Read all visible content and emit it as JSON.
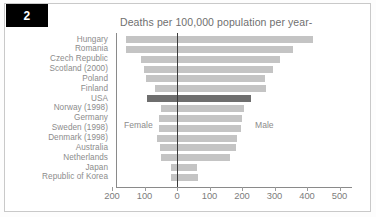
{
  "figure": {
    "number_tab": "2",
    "title": "Deaths per 100,000 population per year-",
    "accent_dark": "#6e6e6e",
    "accent_light": "#c4c4c4",
    "zero_line_color": "#3a3a3a",
    "text_color": "#8c8c8c"
  },
  "labels": {
    "female": "Female",
    "male": "Male"
  },
  "chart_data": {
    "type": "bar",
    "orientation": "horizontal-diverging",
    "title": "Deaths per 100,000 population per year-",
    "xlabel": "",
    "ylabel": "",
    "xlim": [
      -230,
      540
    ],
    "grid": false,
    "legend_position": "inside-plot",
    "annotations": [
      "Female",
      "Male"
    ],
    "tick_values": [
      -200,
      -100,
      0,
      100,
      200,
      300,
      400,
      500
    ],
    "tick_labels": [
      "200",
      "100",
      "0",
      "100",
      "200",
      "300",
      "400",
      "500"
    ],
    "categories": [
      "Hungary",
      "Romania",
      "Czech Republic",
      "Scotland (2000)",
      "Poland",
      "Finland",
      "USA",
      "Norway (1998)",
      "Germany",
      "Sweden (1998)",
      "Denmark (1998)",
      "Australia",
      "Netherlands",
      "Japan",
      "Republic of Korea"
    ],
    "highlight_category": "USA",
    "series": [
      {
        "name": "Female",
        "direction": "left",
        "values": [
          158,
          156,
          110,
          102,
          95,
          67,
          92,
          48,
          55,
          54,
          61,
          51,
          48,
          18,
          20
        ]
      },
      {
        "name": "Male",
        "direction": "right",
        "values": [
          416,
          354,
          314,
          293,
          268,
          272,
          226,
          202,
          196,
          195,
          182,
          178,
          160,
          57,
          62
        ]
      }
    ]
  }
}
